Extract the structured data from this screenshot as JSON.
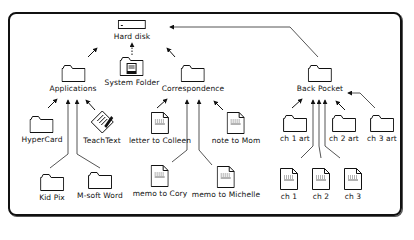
{
  "diagram": {
    "root": {
      "label": "Hard disk",
      "icon": "hard-disk-icon"
    },
    "nodes": [
      {
        "id": "hard-disk",
        "label": "Hard disk",
        "icon": "hard-disk-icon",
        "parent": null
      },
      {
        "id": "system-folder",
        "label": "System Folder",
        "icon": "system-folder-icon",
        "parent": "hard-disk"
      },
      {
        "id": "applications",
        "label": "Applications",
        "icon": "folder-icon",
        "parent": "hard-disk"
      },
      {
        "id": "correspondence",
        "label": "Correspondence",
        "icon": "folder-icon",
        "parent": "hard-disk"
      },
      {
        "id": "back-pocket",
        "label": "Back Pocket",
        "icon": "folder-icon",
        "parent": "hard-disk"
      },
      {
        "id": "hypercard",
        "label": "HyperCard",
        "icon": "folder-icon",
        "parent": "applications"
      },
      {
        "id": "teachtext",
        "label": "TeachText",
        "icon": "teachtext-app-icon",
        "parent": "applications"
      },
      {
        "id": "kid-pix",
        "label": "Kid Pix",
        "icon": "folder-icon",
        "parent": "applications"
      },
      {
        "id": "msoft-word",
        "label": "M-soft Word",
        "icon": "folder-icon",
        "parent": "applications"
      },
      {
        "id": "letter-colleen",
        "label": "letter to Colleen",
        "icon": "document-icon",
        "parent": "correspondence"
      },
      {
        "id": "note-mom",
        "label": "note to Mom",
        "icon": "document-icon",
        "parent": "correspondence"
      },
      {
        "id": "memo-cory",
        "label": "memo to Cory",
        "icon": "document-icon",
        "parent": "correspondence"
      },
      {
        "id": "memo-michelle",
        "label": "memo to Michelle",
        "icon": "document-icon",
        "parent": "correspondence"
      },
      {
        "id": "ch1-art",
        "label": "ch 1 art",
        "icon": "folder-icon",
        "parent": "back-pocket"
      },
      {
        "id": "ch2-art",
        "label": "ch 2 art",
        "icon": "folder-icon",
        "parent": "back-pocket"
      },
      {
        "id": "ch3-art",
        "label": "ch 3 art",
        "icon": "folder-icon",
        "parent": "back-pocket"
      },
      {
        "id": "ch1",
        "label": "ch 1",
        "icon": "document-icon",
        "parent": "back-pocket"
      },
      {
        "id": "ch2",
        "label": "ch 2",
        "icon": "document-icon",
        "parent": "back-pocket"
      },
      {
        "id": "ch3",
        "label": "ch 3",
        "icon": "document-icon",
        "parent": "back-pocket"
      }
    ]
  },
  "colors": {
    "line": "#555555",
    "border": "#111111",
    "background": "#ffffff"
  }
}
